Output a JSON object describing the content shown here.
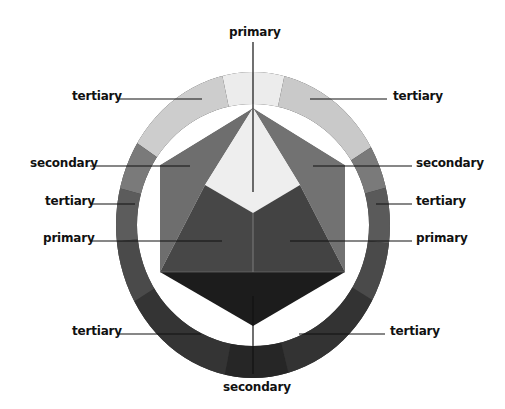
{
  "diagram": {
    "type": "color-wheel",
    "labels": {
      "top": "primary",
      "top_left_tertiary": "tertiary",
      "top_right_tertiary": "tertiary",
      "left_secondary": "secondary",
      "right_secondary": "secondary",
      "left_tertiary": "tertiary",
      "right_tertiary": "tertiary",
      "left_primary": "primary",
      "right_primary": "primary",
      "bottom_left_tertiary": "tertiary",
      "bottom_right_tertiary": "tertiary",
      "bottom": "secondary"
    },
    "colors": {
      "ring_top_primary": "#ececec",
      "ring_top_tertiary": "#cdcdcd",
      "ring_upper_secondary": "#7a7a7a",
      "ring_mid_tertiary": "#5f5f5f",
      "ring_mid_primary": "#4e4e4e",
      "ring_lower_tertiary": "#3a3a3a",
      "ring_bottom_secondary": "#262626",
      "center_light": "#eeeeee",
      "side_secondary": "#6e6e6e",
      "inner_primary": "#474747",
      "bottom_triangle": "#1c1c1c",
      "leader_line": "#111111"
    }
  }
}
